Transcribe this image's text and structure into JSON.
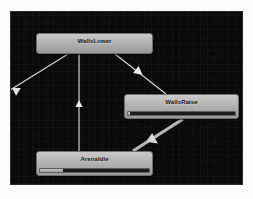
{
  "window": {
    "title": "Animator State Machine",
    "background_color": "#0a0a0a",
    "frame_color": "#fcfcfc"
  },
  "graph": {
    "name": "animator-state-graph",
    "grid_visible": true,
    "grid_color": "#1a1a1a",
    "nodes": [
      {
        "id": "walls-lower",
        "label": "WallsLower",
        "selected": false,
        "has_progress_bar": false,
        "progress_percent": 0
      },
      {
        "id": "walls-raise",
        "label": "WallsRaise",
        "selected": false,
        "has_progress_bar": true,
        "progress_percent": 2
      },
      {
        "id": "arena-idle",
        "label": "ArenaIdle",
        "selected": false,
        "has_progress_bar": true,
        "progress_percent": 21
      }
    ],
    "transitions": [
      {
        "id": "walls-lower-to-offscreen-left",
        "from": "walls-lower",
        "to": "off-screen-left",
        "selected": false,
        "color": "#d0d0d0",
        "arrow_direction": "down-left"
      },
      {
        "id": "walls-lower-to-walls-raise",
        "from": "walls-lower",
        "to": "walls-raise",
        "selected": false,
        "color": "#dedede",
        "arrow_direction": "down-right"
      },
      {
        "id": "arena-idle-to-walls-lower",
        "from": "arena-idle",
        "to": "walls-lower",
        "selected": false,
        "color": "#e2e2e2",
        "arrow_direction": "up"
      },
      {
        "id": "arena-idle-to-walls-raise",
        "from": "arena-idle",
        "to": "walls-raise",
        "selected": true,
        "color": "#bdbdbd",
        "arrow_direction": "up-right"
      }
    ]
  }
}
